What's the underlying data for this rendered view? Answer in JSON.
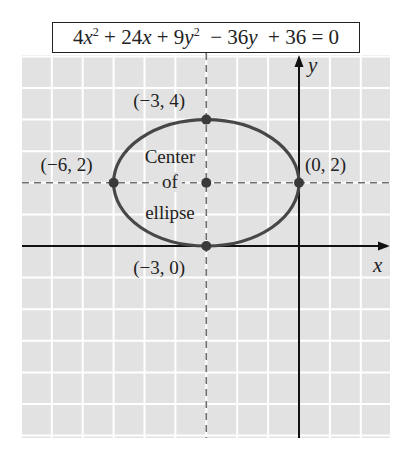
{
  "chart_data": {
    "type": "line",
    "equation_parts": {
      "t1_coef": "4",
      "t1_var": "x",
      "t1_exp": "2",
      "t2": " + 24",
      "t2_var": "x",
      "t3": " + 9",
      "t3_var": "y",
      "t3_exp": "2",
      "t4": "  − 36",
      "t4_var": "y",
      "t5": "  + 36 = 0"
    },
    "xlabel": "x",
    "ylabel": "y",
    "xlim": [
      -9.2,
      2.9
    ],
    "ylim": [
      -6.2,
      6.0
    ],
    "grid": true,
    "ellipse": {
      "name": "ellipse",
      "center": [
        -3,
        2
      ],
      "semi_major_x": 3,
      "semi_minor_y": 2
    },
    "dashed_guides": {
      "vertical_x": -3,
      "horizontal_y": 2
    },
    "points": [
      {
        "name": "top-vertex",
        "x": -3,
        "y": 4,
        "label": "(−3, 4)"
      },
      {
        "name": "left-vertex",
        "x": -6,
        "y": 2,
        "label": "(−6, 2)"
      },
      {
        "name": "right-vertex",
        "x": 0,
        "y": 2,
        "label": "(0, 2)"
      },
      {
        "name": "bottom-vertex",
        "x": -3,
        "y": 0,
        "label": "(−3, 0)"
      },
      {
        "name": "center-point",
        "x": -3,
        "y": 2,
        "label": ""
      }
    ],
    "annotation": {
      "lines": [
        "Center",
        "of",
        "ellipse"
      ]
    }
  },
  "colors": {
    "grid_bg": "#e2e2e2",
    "grid_line": "#ffffff",
    "ellipse": "#474747",
    "axis": "#111111",
    "dashed": "#6e6e6e",
    "point": "#3a3a3a",
    "text": "#222222"
  }
}
